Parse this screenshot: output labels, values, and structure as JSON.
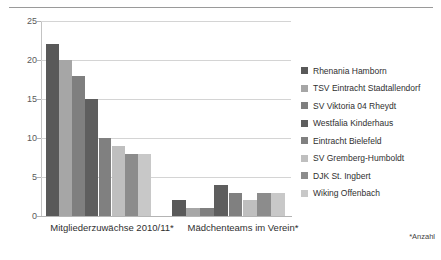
{
  "chart_data": {
    "type": "bar",
    "title": "",
    "subtitle": "",
    "xlabel": "",
    "ylabel": "",
    "ylim": [
      0,
      25
    ],
    "yticks": [
      0,
      5,
      10,
      15,
      20,
      25
    ],
    "grid": true,
    "legend_position": "right",
    "categories": [
      "Mitgliederzuwächse 2010/11*",
      "Mädchenteams im Verein*"
    ],
    "series": [
      {
        "name": "Rhenania Hamborn",
        "color": "#595959",
        "values": [
          22,
          2
        ]
      },
      {
        "name": "TSV Eintracht Stadtallendorf",
        "color": "#a6a6a6",
        "values": [
          20,
          1
        ]
      },
      {
        "name": "SV Viktoria 04 Rheydt",
        "color": "#7f7f7f",
        "values": [
          18,
          1
        ]
      },
      {
        "name": "Westfalia Kinderhaus",
        "color": "#5e5e5e",
        "values": [
          15,
          4
        ]
      },
      {
        "name": "Eintracht Bielefeld",
        "color": "#808080",
        "values": [
          10,
          3
        ]
      },
      {
        "name": "SV Gremberg-Humboldt",
        "color": "#bfbfbf",
        "values": [
          9,
          2
        ]
      },
      {
        "name": "DJK St. Ingbert",
        "color": "#8c8c8c",
        "values": [
          8,
          3
        ]
      },
      {
        "name": "Wiking Offenbach",
        "color": "#c8c8c8",
        "values": [
          8,
          3
        ]
      }
    ],
    "annotations": [
      "*Anzahl"
    ]
  },
  "footnote": "*Anzahl",
  "colors": {
    "gridline": "#d4d4d4",
    "axis": "#b4b4b4",
    "text": "#2f2f2f",
    "rule": "#9a9a9a"
  }
}
